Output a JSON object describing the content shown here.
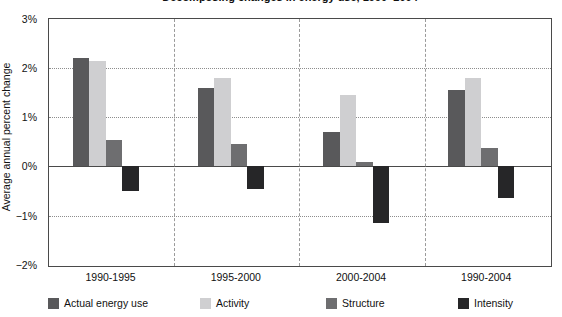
{
  "title_sliver": "Decomposing changes in energy use, 1990–2004",
  "axis": {
    "ylabel": "Average annual percent change",
    "yticks": [
      "3%",
      "2%",
      "1%",
      "0%",
      "−1%",
      "−2%"
    ],
    "ytick_values": [
      3,
      2,
      1,
      0,
      -1,
      -2
    ]
  },
  "legend": [
    {
      "label": "Actual energy use",
      "color": "#59595b"
    },
    {
      "label": "Activity",
      "color": "#cfcfd1"
    },
    {
      "label": "Structure",
      "color": "#6e6e70"
    },
    {
      "label": "Intensity",
      "color": "#262628"
    }
  ],
  "chart_data": {
    "type": "bar",
    "title": "Decomposing changes in energy use, 1990–2004",
    "xlabel": "",
    "ylabel": "Average annual percent change",
    "ylim": [
      -2,
      3
    ],
    "yticks": [
      -2,
      -1,
      0,
      1,
      2,
      3
    ],
    "grid": true,
    "legend_position": "bottom",
    "categories": [
      "1990-1995",
      "1995-2000",
      "2000-2004",
      "1990-2004"
    ],
    "series": [
      {
        "name": "Actual energy use",
        "color": "#59595b",
        "values": [
          2.2,
          1.6,
          0.7,
          1.55
        ]
      },
      {
        "name": "Activity",
        "color": "#cfcfd1",
        "values": [
          2.15,
          1.8,
          1.45,
          1.8
        ]
      },
      {
        "name": "Structure",
        "color": "#6e6e70",
        "values": [
          0.53,
          0.45,
          0.1,
          0.37
        ]
      },
      {
        "name": "Intensity",
        "color": "#262628",
        "values": [
          -0.5,
          -0.45,
          -1.15,
          -0.65
        ]
      }
    ],
    "units": "percent"
  }
}
